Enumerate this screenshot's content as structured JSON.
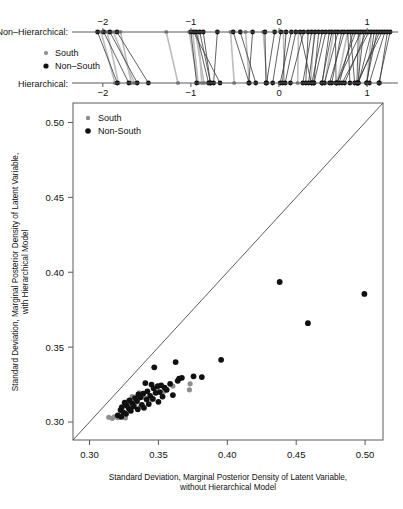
{
  "figure": {
    "type": "two-panel-statistical-figure",
    "background": "#ffffff",
    "colors": {
      "south": "#8e8e8e",
      "non_south": "#101010",
      "axis": "#5a5a5a",
      "reference_line": "#4a4a4a",
      "link_black": "#3a3a3a",
      "link_gray": "#bdbdbd"
    }
  },
  "top_panel": {
    "row_labels": {
      "upper": "Non–Hierarchical:",
      "lower": "Hierarchical:"
    },
    "legend": {
      "items": [
        {
          "label": "South",
          "color": "#8e8e8e"
        },
        {
          "label": "Non–South",
          "color": "#101010"
        }
      ]
    },
    "axis": {
      "ticks": [
        "−2",
        "−1",
        "0",
        "1"
      ],
      "tick_values": [
        -2,
        -1,
        0,
        1
      ],
      "range": [
        -2.35,
        1.35
      ]
    }
  },
  "chart_data": {
    "type": "scatter",
    "title": "",
    "xlabel": "Standard Deviation, Marginal Posterior Density of Latent Variable, without Hierarchical Model",
    "ylabel": "Standard Deviation, Marginal Posterior Density of Latent Variable, with Hierarchical Model",
    "xlabel_line1": "Standard Deviation, Marginal Posterior Density of Latent Variable,",
    "xlabel_line2": "without Hierarchical Model",
    "ylabel_line1": "Standard Deviation, Marginal Posterior Density of Latent Variable,",
    "ylabel_line2": "with Hierarchical Model",
    "xlim": [
      0.288,
      0.513
    ],
    "ylim": [
      0.288,
      0.513
    ],
    "xticks": [
      0.3,
      0.35,
      0.4,
      0.45,
      0.5
    ],
    "xtick_labels": [
      "0.30",
      "0.35",
      "0.40",
      "0.45",
      "0.50"
    ],
    "yticks": [
      0.3,
      0.35,
      0.4,
      0.45,
      0.5
    ],
    "ytick_labels": [
      "0.30",
      "0.35",
      "0.40",
      "0.45",
      "0.50"
    ],
    "grid": false,
    "reference_line": {
      "type": "identity",
      "label": "y = x",
      "from": [
        0.288,
        0.288
      ],
      "to": [
        0.513,
        0.513
      ]
    },
    "legend": {
      "position": "top-left",
      "entries": [
        {
          "label": "South",
          "color": "#8e8e8e"
        },
        {
          "label": "Non-South",
          "color": "#101010"
        }
      ]
    },
    "series": [
      {
        "name": "Non-South",
        "color": "#101010",
        "points": [
          [
            0.438,
            0.3935
          ],
          [
            0.4995,
            0.3855
          ],
          [
            0.4585,
            0.366
          ],
          [
            0.3955,
            0.3415
          ],
          [
            0.3625,
            0.34
          ],
          [
            0.347,
            0.3365
          ],
          [
            0.3755,
            0.3305
          ],
          [
            0.3815,
            0.33
          ],
          [
            0.367,
            0.3295
          ],
          [
            0.365,
            0.329
          ],
          [
            0.364,
            0.3275
          ],
          [
            0.3405,
            0.326
          ],
          [
            0.3585,
            0.3255
          ],
          [
            0.345,
            0.325
          ],
          [
            0.352,
            0.3245
          ],
          [
            0.3495,
            0.324
          ],
          [
            0.3545,
            0.323
          ],
          [
            0.3465,
            0.3225
          ],
          [
            0.356,
            0.3215
          ],
          [
            0.342,
            0.3205
          ],
          [
            0.351,
            0.32
          ],
          [
            0.348,
            0.3195
          ],
          [
            0.339,
            0.319
          ],
          [
            0.3355,
            0.3185
          ],
          [
            0.3605,
            0.318
          ],
          [
            0.344,
            0.3175
          ],
          [
            0.353,
            0.317
          ],
          [
            0.337,
            0.3165
          ],
          [
            0.333,
            0.316
          ],
          [
            0.346,
            0.3155
          ],
          [
            0.3415,
            0.315
          ],
          [
            0.329,
            0.3145
          ],
          [
            0.3345,
            0.314
          ],
          [
            0.35,
            0.3135
          ],
          [
            0.3255,
            0.313
          ],
          [
            0.331,
            0.3125
          ],
          [
            0.343,
            0.312
          ],
          [
            0.338,
            0.3115
          ],
          [
            0.327,
            0.311
          ],
          [
            0.332,
            0.3105
          ],
          [
            0.3235,
            0.31
          ],
          [
            0.3395,
            0.3095
          ],
          [
            0.3285,
            0.309
          ],
          [
            0.335,
            0.3085
          ],
          [
            0.3225,
            0.308
          ],
          [
            0.33,
            0.3075
          ],
          [
            0.3245,
            0.3065
          ],
          [
            0.3265,
            0.3055
          ],
          [
            0.3205,
            0.3045
          ],
          [
            0.323,
            0.3035
          ]
        ]
      },
      {
        "name": "South",
        "color": "#8e8e8e",
        "points": [
          [
            0.373,
            0.3255
          ],
          [
            0.3605,
            0.324
          ],
          [
            0.3725,
            0.3215
          ],
          [
            0.349,
            0.323
          ],
          [
            0.354,
            0.3205
          ],
          [
            0.336,
            0.3195
          ],
          [
            0.331,
            0.317
          ],
          [
            0.3405,
            0.316
          ],
          [
            0.3455,
            0.315
          ],
          [
            0.3275,
            0.3135
          ],
          [
            0.333,
            0.312
          ],
          [
            0.337,
            0.3105
          ],
          [
            0.323,
            0.3095
          ],
          [
            0.3295,
            0.3085
          ],
          [
            0.318,
            0.3035
          ],
          [
            0.3205,
            0.303
          ],
          [
            0.326,
            0.3028
          ],
          [
            0.314,
            0.3032
          ],
          [
            0.3165,
            0.3025
          ]
        ]
      }
    ]
  }
}
